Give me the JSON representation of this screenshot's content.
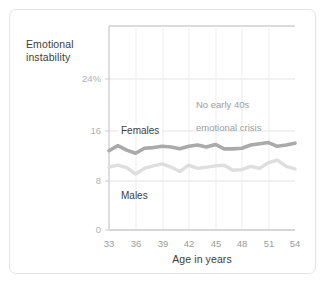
{
  "chart_data": {
    "type": "line",
    "title": "",
    "subtitle": "",
    "xlabel": "Age in years",
    "ylabel": "Emotional instability",
    "xlim": [
      33,
      54
    ],
    "ylim": [
      0,
      28
    ],
    "xticks": [
      "33",
      "36",
      "39",
      "42",
      "45",
      "48",
      "51",
      "54"
    ],
    "xtick_values": [
      33,
      36,
      39,
      42,
      45,
      48,
      51,
      54
    ],
    "yticks": [
      "0",
      "8",
      "16",
      "24%"
    ],
    "ytick_values": [
      0,
      8,
      16,
      24
    ],
    "grid": "horizontal-and-vertical-light",
    "legend_position": "inline-labels",
    "x": [
      33,
      34,
      35,
      36,
      37,
      38,
      39,
      40,
      41,
      42,
      43,
      44,
      45,
      46,
      47,
      48,
      49,
      50,
      51,
      52,
      53,
      54
    ],
    "series": [
      {
        "name": "Females",
        "color": "#aaaaaa",
        "values": [
          12.6,
          13.4,
          12.7,
          12.2,
          13.0,
          13.1,
          13.3,
          13.2,
          12.9,
          13.3,
          13.5,
          13.2,
          13.6,
          12.9,
          12.9,
          13.0,
          13.5,
          13.7,
          13.9,
          13.3,
          13.5,
          13.8
        ]
      },
      {
        "name": "Males",
        "color": "#dedede",
        "values": [
          10.0,
          10.3,
          9.9,
          8.9,
          9.8,
          10.2,
          10.5,
          10.0,
          9.3,
          10.3,
          9.8,
          10.0,
          10.2,
          10.3,
          9.5,
          9.6,
          10.1,
          9.8,
          10.7,
          11.1,
          10.1,
          9.7
        ]
      }
    ],
    "annotations": [
      {
        "text": "No early 40s\nemotional crisis",
        "x": 44.5,
        "y": 21
      }
    ],
    "series_inline_labels": [
      {
        "name": "Females",
        "x": 35.0,
        "y": 16
      },
      {
        "name": "Males",
        "x": 35.0,
        "y": 6.2
      }
    ]
  },
  "axis": {
    "ylabel_line1": "Emotional",
    "ylabel_line2": "instability",
    "xlabel": "Age in years"
  },
  "yticks": {
    "t24": "24%",
    "t16": "16",
    "t8": "8",
    "t0": "0"
  },
  "xticks": {
    "t33": "33",
    "t36": "36",
    "t39": "39",
    "t42": "42",
    "t45": "45",
    "t48": "48",
    "t51": "51",
    "t54": "54"
  },
  "labels": {
    "females": "Females",
    "males": "Males",
    "annotation_line1": "No early 40s",
    "annotation_line2": "emotional crisis"
  },
  "colors": {
    "females_line": "#aaaaaa",
    "males_line": "#dedede",
    "grid": "#e6e6e6",
    "axis_text": "#3d3d3d",
    "tick_text": "#9c9c9c",
    "card_border": "#e4e4e4"
  }
}
